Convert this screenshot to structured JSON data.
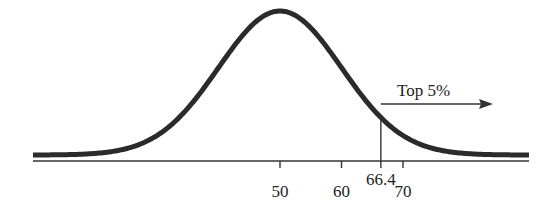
{
  "chart_data": {
    "type": "line",
    "title": "",
    "distribution": {
      "mean": 50,
      "sd": 10
    },
    "x_ticks": [
      {
        "value": 50,
        "label": "50"
      },
      {
        "value": 60,
        "label": "60"
      },
      {
        "value": 66.4,
        "label": "66.4"
      },
      {
        "value": 70,
        "label": "70"
      }
    ],
    "cutoff": {
      "value": 66.4,
      "label": "66.4"
    },
    "annotations": [
      {
        "text": "Top 5%",
        "arrow": "right",
        "anchor_x": 66.4
      }
    ],
    "xlabel": "",
    "ylabel": "",
    "grid": false,
    "legend": null
  },
  "colors": {
    "curve": "#2b2b2b",
    "axis": "#333333",
    "text": "#222222"
  }
}
